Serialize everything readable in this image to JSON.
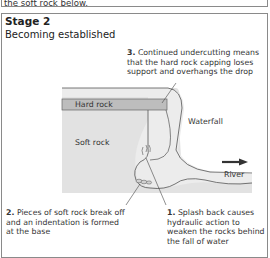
{
  "previous_panel": {
    "trailing_text": "the soft rock below."
  },
  "stage": {
    "title": "Stage 2",
    "subtitle": "Becoming established"
  },
  "labels": {
    "hard_rock": "Hard rock",
    "soft_rock": "Soft rock",
    "waterfall": "Waterfall",
    "river": "River"
  },
  "notes": [
    {
      "number": "3.",
      "lines": [
        "Continued undercutting means",
        "that the hard rock capping loses",
        "support and overhangs the drop"
      ]
    },
    {
      "number": "2.",
      "lines": [
        "Pieces of soft rock break off",
        "and an indentation is formed",
        "at the base"
      ]
    },
    {
      "number": "1.",
      "lines": [
        "Splash back causes",
        "hydraulic action to",
        "weaken the rocks behind",
        "the fall of water"
      ]
    }
  ],
  "colors": {
    "hard_rock": "#bdbdbd",
    "soft_rock": "#e2e2e2",
    "water": "#ebebeb",
    "border": "#8a8a8a",
    "outline": "#555555",
    "arrow": "#333333"
  }
}
